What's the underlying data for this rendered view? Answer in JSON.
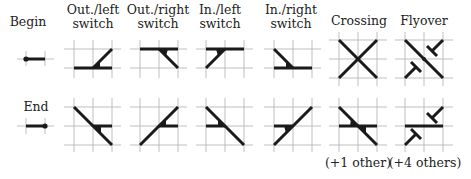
{
  "columns": [
    {
      "id": "begin-end",
      "header": [
        "Begin"
      ],
      "row2_label": "End",
      "cx": 35
    },
    {
      "id": "out-left",
      "header": [
        "Out./left",
        "switch"
      ],
      "cx": 93
    },
    {
      "id": "out-right",
      "header": [
        "Out./right",
        "switch"
      ],
      "cx": 157
    },
    {
      "id": "in-left",
      "header": [
        "In./left",
        "switch"
      ],
      "cx": 220
    },
    {
      "id": "in-right",
      "header": [
        "In./right",
        "switch"
      ],
      "cx": 281
    },
    {
      "id": "crossing",
      "header": [
        "Crossing"
      ],
      "footnote": "(+1 other)",
      "cx": 358
    },
    {
      "id": "flyover",
      "header": [
        "Flyover"
      ],
      "footnote": "(+4 others)",
      "cx": 425
    }
  ],
  "labels": {
    "begin": "Begin",
    "end": "End",
    "out_left_1": "Out./left",
    "out_left_2": "switch",
    "out_right_1": "Out./right",
    "out_right_2": "switch",
    "in_left_1": "In./left",
    "in_left_2": "switch",
    "in_right_1": "In./right",
    "in_right_2": "switch",
    "crossing": "Crossing",
    "flyover": "Flyover",
    "crossing_note": "(+1 other)",
    "flyover_note": "(+4 others)"
  },
  "colors": {
    "track": "#1a1a1a",
    "grid": "#b8b8b8",
    "background": "#ffffff"
  }
}
